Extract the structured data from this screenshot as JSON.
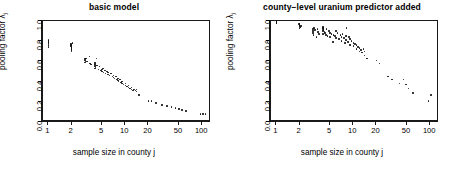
{
  "figure": {
    "xlabel": "sample size in county j",
    "ylabel_prefix": "pooling factor ",
    "ylabel_symbol": "λ",
    "ylabel_sub": "j"
  },
  "chart_data": [
    {
      "type": "scatter",
      "title": "basic model",
      "xlabel": "sample size in county j",
      "ylabel": "pooling factor λ_j",
      "xscale": "log",
      "xlim": [
        0.85,
        130
      ],
      "ylim": [
        0.0,
        1.0
      ],
      "xticks": [
        1,
        2,
        5,
        10,
        20,
        50,
        100
      ],
      "xticklabels": [
        "1",
        "2",
        "5",
        "10",
        "20",
        "50",
        "100"
      ],
      "yticks": [
        0.0,
        0.2,
        0.4,
        0.6,
        0.8,
        1.0
      ],
      "yticklabels": [
        "0.0",
        "0.2",
        "0.4",
        "0.6",
        "0.8",
        "1.0"
      ],
      "grid": false,
      "legend": "none",
      "marker": "point",
      "color": "#111111",
      "x": [
        1,
        1,
        1,
        1,
        1,
        1,
        1.95,
        1.95,
        1.95,
        2,
        2,
        2,
        2.05,
        2,
        2,
        3,
        3,
        3,
        3.05,
        3.1,
        3,
        3.2,
        3.4,
        3.5,
        3.6,
        4,
        4,
        4,
        4,
        4.05,
        4.1,
        4.2,
        4,
        4.3,
        4.5,
        4.6,
        4.8,
        5,
        5,
        5.1,
        5.2,
        5.4,
        5.5,
        5.8,
        6,
        6,
        6.2,
        6.5,
        6.8,
        7,
        7,
        7.2,
        7.5,
        7.8,
        8,
        8,
        8.2,
        8.5,
        8.8,
        9,
        9,
        9.5,
        10,
        10,
        10.5,
        11,
        11,
        11.5,
        12,
        12,
        12.5,
        13,
        13.5,
        14,
        14,
        15,
        20,
        22,
        25,
        30,
        35,
        40,
        45,
        50,
        55,
        62,
        95,
        102,
        110
      ],
      "y": [
        0.78,
        0.79,
        0.8,
        0.81,
        0.76,
        0.74,
        0.76,
        0.77,
        0.75,
        0.74,
        0.73,
        0.72,
        0.78,
        0.71,
        0.7,
        0.62,
        0.63,
        0.61,
        0.6,
        0.63,
        0.59,
        0.6,
        0.65,
        0.58,
        0.57,
        0.56,
        0.57,
        0.58,
        0.55,
        0.59,
        0.54,
        0.63,
        0.53,
        0.56,
        0.52,
        0.55,
        0.51,
        0.5,
        0.52,
        0.53,
        0.49,
        0.51,
        0.48,
        0.5,
        0.47,
        0.49,
        0.46,
        0.48,
        0.45,
        0.44,
        0.46,
        0.43,
        0.45,
        0.42,
        0.41,
        0.43,
        0.4,
        0.42,
        0.39,
        0.38,
        0.4,
        0.37,
        0.36,
        0.38,
        0.35,
        0.34,
        0.36,
        0.33,
        0.32,
        0.34,
        0.31,
        0.32,
        0.31,
        0.3,
        0.32,
        0.27,
        0.21,
        0.21,
        0.19,
        0.17,
        0.16,
        0.15,
        0.14,
        0.13,
        0.12,
        0.11,
        0.08,
        0.08,
        0.08
      ]
    },
    {
      "type": "scatter",
      "title": "county−level uranium predictor added",
      "xlabel": "sample size in county j",
      "ylabel": "pooling factor λ_j",
      "xscale": "log",
      "xlim": [
        0.85,
        130
      ],
      "ylim": [
        0.0,
        1.0
      ],
      "xticks": [
        1,
        2,
        5,
        10,
        20,
        50,
        100
      ],
      "xticklabels": [
        "1",
        "2",
        "5",
        "10",
        "20",
        "50",
        "100"
      ],
      "yticks": [
        0.0,
        0.2,
        0.4,
        0.6,
        0.8,
        1.0
      ],
      "yticklabels": [
        "0.0",
        "0.2",
        "0.4",
        "0.6",
        "0.8",
        "1.0"
      ],
      "grid": false,
      "legend": "none",
      "marker": "point",
      "color": "#111111",
      "x": [
        1,
        1,
        1,
        1,
        1,
        1,
        1.95,
        2,
        2,
        2,
        2.05,
        2,
        2.1,
        2,
        2,
        3,
        3,
        3,
        3.05,
        3.1,
        3.2,
        3.3,
        3.4,
        3.5,
        3.6,
        4,
        4,
        4,
        4.05,
        4.1,
        4.2,
        4.3,
        4,
        4.4,
        4.5,
        4.6,
        4.8,
        5,
        5,
        5.2,
        5.4,
        5.5,
        5.8,
        6,
        6,
        6.2,
        6.5,
        6.8,
        7,
        7,
        7.2,
        7.5,
        7.8,
        8,
        8,
        8.2,
        8.5,
        8.8,
        9,
        9,
        9.5,
        10,
        10,
        10.5,
        11,
        11,
        11.5,
        12,
        12,
        12.5,
        13,
        13.5,
        14,
        14,
        15,
        20,
        22,
        28,
        32,
        40,
        45,
        48,
        52,
        60,
        95,
        102
      ],
      "y": [
        0.99,
        0.99,
        0.98,
        1.0,
        0.99,
        0.98,
        0.97,
        0.96,
        0.95,
        0.97,
        0.94,
        0.96,
        0.95,
        0.93,
        0.96,
        0.92,
        0.88,
        0.9,
        0.86,
        0.93,
        0.91,
        0.84,
        0.92,
        0.89,
        0.87,
        0.93,
        0.92,
        0.9,
        0.94,
        0.91,
        0.89,
        0.88,
        0.87,
        0.86,
        0.92,
        0.85,
        0.9,
        0.88,
        0.84,
        0.87,
        0.79,
        0.86,
        0.85,
        0.9,
        0.83,
        0.88,
        0.82,
        0.86,
        0.84,
        0.8,
        0.87,
        0.83,
        0.78,
        0.85,
        0.81,
        0.93,
        0.79,
        0.84,
        0.82,
        0.76,
        0.8,
        0.75,
        0.78,
        0.77,
        0.72,
        0.76,
        0.74,
        0.7,
        0.73,
        0.71,
        0.69,
        0.72,
        0.66,
        0.7,
        0.63,
        0.61,
        0.58,
        0.45,
        0.42,
        0.38,
        0.42,
        0.37,
        0.33,
        0.29,
        0.21,
        0.27
      ]
    }
  ]
}
